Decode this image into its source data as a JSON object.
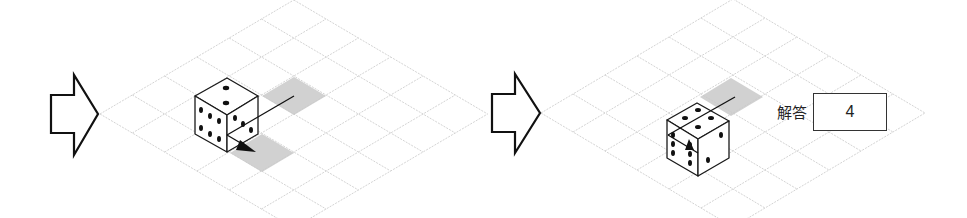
{
  "panels": [
    {
      "id": "step-before",
      "grid": {
        "rows": 6,
        "cols": 6,
        "origin": [
          100,
          114
        ],
        "step_x": 32.3,
        "step_y": 19
      },
      "transition_arrow": {
        "x": 51,
        "y": 75,
        "icon": "right-arrow-icon"
      },
      "shaded_cells": [
        {
          "points": "262,96 294,77 326,96 294,115"
        },
        {
          "points": "230,153 262,134 294,153 262,172"
        }
      ],
      "die": {
        "top_face_pips": 2,
        "left_face_pips": 6,
        "right_face_pips": 3
      },
      "move_path": {
        "description": "line from upper shaded cell through die, arrowhead pointing to lower shaded cell"
      }
    },
    {
      "id": "step-after",
      "grid": {
        "rows": 6,
        "cols": 6,
        "origin": [
          541,
          113
        ],
        "step_x": 32,
        "step_y": 19
      },
      "transition_arrow": {
        "x": 492,
        "y": 74,
        "icon": "right-arrow-icon"
      },
      "shaded_cells": [
        {
          "points": "700,97 731,78 763,97 731,116"
        }
      ],
      "die": {
        "top_face_pips": 4,
        "left_face_pips": 6,
        "right_face_pips": 2
      }
    }
  ],
  "answer": {
    "label": "解答",
    "value": "4"
  },
  "colors": {
    "grid": "#c8c8c8",
    "shade": "#c9c9c9",
    "outline": "#111111"
  }
}
